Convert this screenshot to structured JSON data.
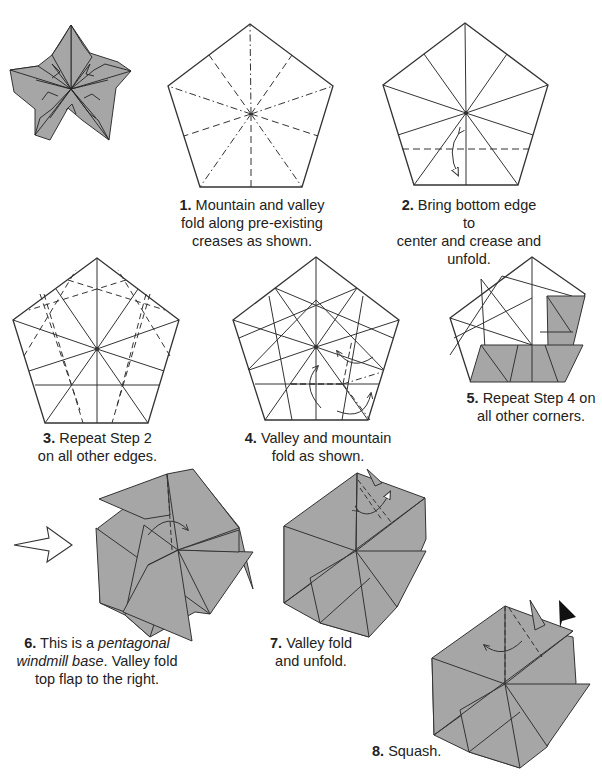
{
  "diagram": {
    "title_image": "finished-pentagonal-star",
    "colors": {
      "paper_colored": "#a6a6a6",
      "paper_white": "#ffffff",
      "line": "#333333",
      "arrowhead_black": "#111111"
    },
    "steps": [
      {
        "number": "1.",
        "text": "Mountain and valley fold along pre-existing creases as shown."
      },
      {
        "number": "2.",
        "text": "Bring bottom edge to center and crease and unfold."
      },
      {
        "number": "3.",
        "text": "Repeat Step 2 on all other edges."
      },
      {
        "number": "4.",
        "text": "Valley and mountain fold as shown."
      },
      {
        "number": "5.",
        "text": "Repeat Step 4 on all other corners."
      },
      {
        "number": "6.",
        "text_pre": "This is a ",
        "text_italic": "pentagonal windmill base",
        "text_post": ".  Valley fold top flap to the right."
      },
      {
        "number": "7.",
        "text": "Valley fold and unfold."
      },
      {
        "number": "8.",
        "text": "Squash."
      }
    ],
    "captions": {
      "s1_l1": "Mountain and valley",
      "s1_l2": "fold along pre-existing",
      "s1_l3": "creases as shown.",
      "s2_l1": "Bring bottom edge to",
      "s2_l2": "center and crease and",
      "s2_l3": "unfold.",
      "s3_l1": "Repeat Step 2",
      "s3_l2": "on all other edges.",
      "s4_l1": "Valley and mountain",
      "s4_l2": "fold as shown.",
      "s5_l1": "Repeat Step 4 on",
      "s5_l2": "all other corners.",
      "s6_l1a": "This is a ",
      "s6_l1b": "pentagonal",
      "s6_l2a": "windmill base",
      "s6_l2b": ".  Valley fold",
      "s6_l3": "top flap to the right.",
      "s7_l1": "Valley fold",
      "s7_l2": "and unfold.",
      "s8_l1": "Squash."
    },
    "icons": [
      "finished-star-model",
      "hollow-right-arrow-icon",
      "curved-fold-arrow-icon",
      "squash-arrowhead-icon"
    ]
  }
}
